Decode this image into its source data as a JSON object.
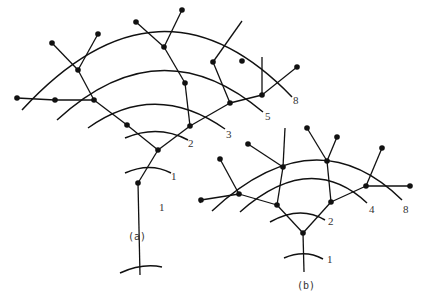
{
  "figure": {
    "panels": [
      {
        "id": "a",
        "caption": "(a)",
        "caption_pos": [
          128,
          240
        ],
        "arcs": [
          {
            "d": "M 120 273 Q 142 263 162 267",
            "label": "1",
            "label_pos": [
              159,
              211
            ]
          },
          {
            "d": "M 125 173 Q 150 162 171 173",
            "label": "1",
            "label_pos": [
              171,
              180
            ]
          },
          {
            "d": "M 125 138 Q 158 124 188 140",
            "label": "2",
            "label_pos": [
              188,
              147
            ]
          },
          {
            "d": "M 88 128 Q 155 80 225 129",
            "label": "3",
            "label_pos": [
              226,
              138
            ]
          },
          {
            "d": "M 57 120 Q 160 25 263 112",
            "label": "5",
            "label_pos": [
              265,
              120
            ]
          },
          {
            "d": "M 22 110 Q 160 -40 292 97",
            "label": "8",
            "label_pos": [
              293,
              104
            ]
          }
        ],
        "nodes": [
          [
            138,
            183
          ],
          [
            158,
            150
          ],
          [
            127,
            125
          ],
          [
            94,
            100
          ],
          [
            55,
            100
          ],
          [
            17,
            98
          ],
          [
            78,
            70
          ],
          [
            52,
            43
          ],
          [
            98,
            34
          ],
          [
            164,
            47
          ],
          [
            136,
            22
          ],
          [
            182,
            10
          ],
          [
            190,
            126
          ],
          [
            185,
            83
          ],
          [
            230,
            103
          ],
          [
            213,
            62
          ],
          [
            242,
            61
          ],
          [
            262,
            95
          ],
          [
            297,
            67
          ]
        ],
        "edges": [
          [
            [
              140,
              275
            ],
            [
              138,
              183
            ]
          ],
          [
            [
              138,
              183
            ],
            [
              158,
              150
            ]
          ],
          [
            [
              158,
              150
            ],
            [
              127,
              125
            ]
          ],
          [
            [
              127,
              125
            ],
            [
              94,
              100
            ]
          ],
          [
            [
              94,
              100
            ],
            [
              55,
              100
            ]
          ],
          [
            [
              55,
              100
            ],
            [
              17,
              98
            ]
          ],
          [
            [
              94,
              100
            ],
            [
              78,
              70
            ]
          ],
          [
            [
              78,
              70
            ],
            [
              52,
              43
            ]
          ],
          [
            [
              78,
              70
            ],
            [
              98,
              34
            ]
          ],
          [
            [
              158,
              150
            ],
            [
              190,
              126
            ]
          ],
          [
            [
              190,
              126
            ],
            [
              185,
              83
            ]
          ],
          [
            [
              185,
              83
            ],
            [
              164,
              47
            ]
          ],
          [
            [
              164,
              47
            ],
            [
              136,
              22
            ]
          ],
          [
            [
              164,
              47
            ],
            [
              182,
              10
            ]
          ],
          [
            [
              190,
              126
            ],
            [
              230,
              103
            ]
          ],
          [
            [
              230,
              103
            ],
            [
              213,
              62
            ]
          ],
          [
            [
              213,
              62
            ],
            [
              242,
              21
            ]
          ],
          [
            [
              230,
              103
            ],
            [
              262,
              95
            ]
          ],
          [
            [
              262,
              95
            ],
            [
              262,
              57
            ]
          ],
          [
            [
              262,
              95
            ],
            [
              297,
              67
            ]
          ]
        ]
      },
      {
        "id": "b",
        "caption": "(b)",
        "caption_pos": [
          297,
          289
        ],
        "arcs": [
          {
            "d": "M 284 258 Q 305 249 323 259",
            "label": "1",
            "label_pos": [
              327,
              263
            ]
          },
          {
            "d": "M 270 222 Q 300 205 325 220",
            "label": "2",
            "label_pos": [
              328,
              225
            ]
          },
          {
            "d": "M 240 212 Q 310 150 367 203",
            "label": "4",
            "label_pos": [
              369,
              213
            ]
          },
          {
            "d": "M 212 211 Q 315 115 402 200",
            "label": "8",
            "label_pos": [
              403,
              213
            ]
          }
        ],
        "nodes": [
          [
            303,
            233
          ],
          [
            277,
            205
          ],
          [
            239,
            194
          ],
          [
            201,
            200
          ],
          [
            220,
            159
          ],
          [
            283,
            167
          ],
          [
            248,
            144
          ],
          [
            331,
            202
          ],
          [
            327,
            161
          ],
          [
            307,
            128
          ],
          [
            337,
            137
          ],
          [
            366,
            186
          ],
          [
            382,
            148
          ],
          [
            410,
            186
          ]
        ],
        "edges": [
          [
            [
              304,
              272
            ],
            [
              303,
              233
            ]
          ],
          [
            [
              303,
              233
            ],
            [
              277,
              205
            ]
          ],
          [
            [
              277,
              205
            ],
            [
              239,
              194
            ]
          ],
          [
            [
              239,
              194
            ],
            [
              201,
              200
            ]
          ],
          [
            [
              201,
              200
            ],
            [
              200,
              203
            ]
          ],
          [
            [
              239,
              194
            ],
            [
              220,
              159
            ]
          ],
          [
            [
              277,
              205
            ],
            [
              283,
              167
            ]
          ],
          [
            [
              283,
              167
            ],
            [
              248,
              144
            ]
          ],
          [
            [
              283,
              167
            ],
            [
              285,
              128
            ]
          ],
          [
            [
              303,
              233
            ],
            [
              331,
              202
            ]
          ],
          [
            [
              331,
              202
            ],
            [
              327,
              161
            ]
          ],
          [
            [
              327,
              161
            ],
            [
              307,
              128
            ]
          ],
          [
            [
              327,
              161
            ],
            [
              337,
              137
            ]
          ],
          [
            [
              331,
              202
            ],
            [
              366,
              186
            ]
          ],
          [
            [
              366,
              186
            ],
            [
              382,
              148
            ]
          ],
          [
            [
              366,
              186
            ],
            [
              410,
              186
            ]
          ]
        ]
      }
    ]
  }
}
